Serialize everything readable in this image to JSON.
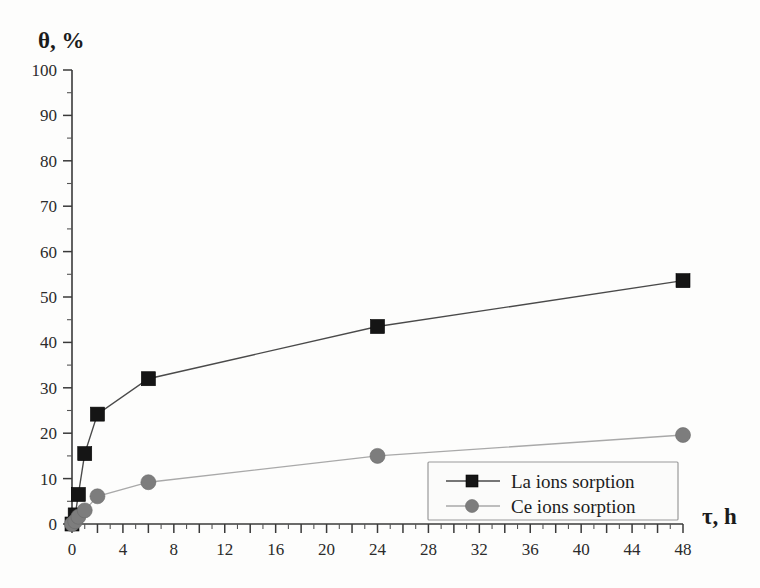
{
  "chart_data": {
    "type": "line",
    "title": "",
    "xlabel": "τ, h",
    "ylabel": "θ, %",
    "xlim": [
      0,
      48
    ],
    "ylim": [
      0,
      100
    ],
    "xticks": [
      0,
      4,
      8,
      12,
      16,
      20,
      24,
      28,
      32,
      36,
      40,
      44,
      48
    ],
    "yticks": [
      0,
      10,
      20,
      30,
      40,
      50,
      60,
      70,
      80,
      90,
      100
    ],
    "xtick_labels": [
      "0",
      "4",
      "8",
      "12",
      "16",
      "20",
      "24",
      "28",
      "32",
      "36",
      "40",
      "44",
      "48"
    ],
    "ytick_labels": [
      "0",
      "10",
      "20",
      "30",
      "40",
      "50",
      "60",
      "70",
      "80",
      "90",
      "100"
    ],
    "x_minor_step": 1,
    "y_minor_step": 5,
    "grid": false,
    "legend_position": "lower right",
    "series": [
      {
        "name": "La ions sorption",
        "marker": "square",
        "color": "#151515",
        "line_color": "#4a4a4a",
        "x": [
          0,
          0.25,
          0.5,
          1,
          2,
          6,
          24,
          48
        ],
        "values": [
          0,
          2.0,
          6.5,
          15.5,
          24.2,
          32.0,
          43.5,
          53.6
        ]
      },
      {
        "name": "Ce ions sorption",
        "marker": "circle",
        "color": "#7d7d7d",
        "line_color": "#a9a9a9",
        "x": [
          0,
          0.25,
          0.5,
          1,
          2,
          6,
          24,
          48
        ],
        "values": [
          0,
          0.6,
          1.6,
          3.0,
          6.1,
          9.2,
          15.0,
          19.6
        ]
      }
    ]
  },
  "legend": {
    "entries": [
      {
        "label": "La ions sorption"
      },
      {
        "label": "Ce ions sorption"
      }
    ]
  },
  "axes": {
    "y_axis_title": "θ, %",
    "x_axis_title": "τ, h"
  }
}
